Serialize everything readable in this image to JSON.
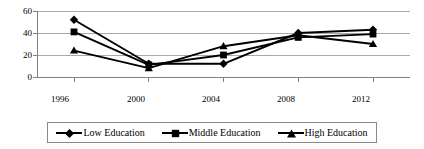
{
  "chart_data": {
    "type": "line",
    "title": "",
    "xlabel": "",
    "ylabel": "",
    "categories": [
      "1996",
      "2000",
      "2004",
      "2008",
      "2012"
    ],
    "ylim": [
      0,
      60
    ],
    "yticks": [
      0,
      20,
      40,
      60
    ],
    "ytick_labels": [
      "0",
      "20",
      "40",
      "60"
    ],
    "grid": true,
    "legend_position": "bottom",
    "series": [
      {
        "name": "Low Education",
        "marker": "diamond",
        "color": "#000000",
        "values": [
          52,
          12,
          12,
          40,
          43
        ]
      },
      {
        "name": "Middle Education",
        "marker": "square",
        "color": "#000000",
        "values": [
          41,
          11,
          20,
          36,
          39
        ]
      },
      {
        "name": "High Education",
        "marker": "triangle",
        "color": "#000000",
        "values": [
          24,
          8,
          28,
          38,
          30
        ]
      }
    ]
  },
  "axes": {
    "y_tick_0": "0",
    "y_tick_20": "20",
    "y_tick_40": "40",
    "y_tick_60": "60",
    "x_tick_1996": "1996",
    "x_tick_2000": "2000",
    "x_tick_2004": "2004",
    "x_tick_2008": "2008",
    "x_tick_2012": "2012"
  },
  "legend": {
    "items": [
      {
        "label": "Low Education",
        "marker": "diamond-marker-icon"
      },
      {
        "label": "Middle Education",
        "marker": "square-marker-icon"
      },
      {
        "label": "High Education",
        "marker": "triangle-marker-icon"
      }
    ]
  }
}
